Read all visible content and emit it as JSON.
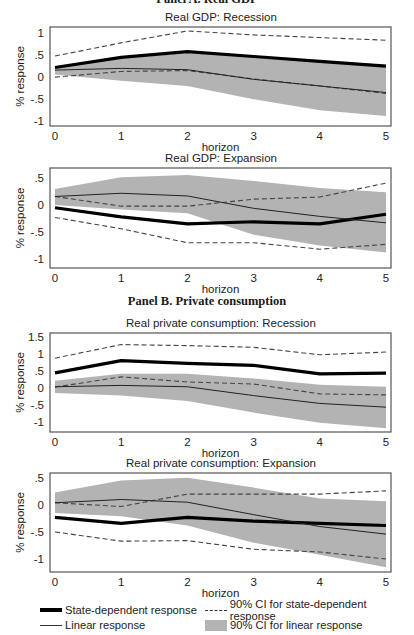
{
  "panels": [
    {
      "title": "Panel A. Real GDP",
      "top": -8
    },
    {
      "title": "Panel B. Private consumption",
      "top": 299
    }
  ],
  "chart_data": [
    {
      "type": "line",
      "title": "Real GDP: Recession",
      "xlabel": "horizon",
      "ylabel": "% response",
      "x": [
        0,
        1,
        2,
        3,
        4,
        5
      ],
      "yticks": [
        1,
        0.5,
        0,
        -0.5,
        -1
      ],
      "ytick_labels": [
        "1",
        ".5",
        "0",
        "-.5",
        "-1"
      ],
      "ylim": [
        -1.11,
        1.14
      ],
      "series": [
        {
          "name": "State-dependent response",
          "style": "thick",
          "values": [
            0.22,
            0.45,
            0.58,
            0.47,
            0.36,
            0.25
          ]
        },
        {
          "name": "90% CI for state-dependent response (upper)",
          "style": "dashed",
          "values": [
            0.48,
            0.78,
            1.05,
            0.96,
            0.9,
            0.84
          ]
        },
        {
          "name": "90% CI for state-dependent response (lower)",
          "style": "dashed",
          "values": [
            0.0,
            0.13,
            0.15,
            -0.04,
            -0.2,
            -0.37
          ]
        },
        {
          "name": "Linear response",
          "style": "thin",
          "values": [
            0.16,
            0.2,
            0.17,
            -0.05,
            -0.2,
            -0.35
          ]
        }
      ],
      "band": {
        "name": "90% CI for linear response",
        "upper": [
          0.25,
          0.42,
          0.55,
          0.46,
          0.37,
          0.28
        ],
        "lower": [
          0.06,
          -0.08,
          -0.2,
          -0.5,
          -0.75,
          -0.88
        ]
      }
    },
    {
      "type": "line",
      "title": "Real GDP: Expansion",
      "xlabel": "horizon",
      "ylabel": "% response",
      "x": [
        0,
        1,
        2,
        3,
        4,
        5
      ],
      "yticks": [
        0.5,
        0,
        -0.5,
        -1
      ],
      "ytick_labels": [
        ".5",
        "0",
        "-.5",
        "-1"
      ],
      "ylim": [
        -1.17,
        0.69
      ],
      "series": [
        {
          "name": "State-dependent response",
          "style": "thick",
          "values": [
            -0.05,
            -0.22,
            -0.35,
            -0.31,
            -0.35,
            -0.17
          ]
        },
        {
          "name": "90% CI for state-dependent response (upper)",
          "style": "dashed",
          "values": [
            0.16,
            -0.02,
            -0.02,
            0.11,
            0.15,
            0.41
          ]
        },
        {
          "name": "90% CI for state-dependent response (lower)",
          "style": "dashed",
          "values": [
            -0.23,
            -0.44,
            -0.7,
            -0.7,
            -0.82,
            -0.73
          ]
        },
        {
          "name": "Linear response",
          "style": "thin",
          "values": [
            0.16,
            0.22,
            0.17,
            -0.06,
            -0.21,
            -0.33
          ]
        }
      ],
      "band": {
        "name": "90% CI for linear response",
        "upper": [
          0.3,
          0.52,
          0.56,
          0.45,
          0.32,
          0.24
        ],
        "lower": [
          0.0,
          -0.08,
          -0.15,
          -0.55,
          -0.75,
          -0.88
        ]
      }
    },
    {
      "type": "line",
      "title": "Real private consumption: Recession",
      "xlabel": "horizon",
      "ylabel": "% response",
      "x": [
        0,
        1,
        2,
        3,
        4,
        5
      ],
      "yticks": [
        1.5,
        1,
        0.5,
        0,
        -0.5,
        -1
      ],
      "ytick_labels": [
        "1.5",
        "1",
        ".5",
        "0",
        "-.5",
        "-1"
      ],
      "ylim": [
        -1.29,
        1.62
      ],
      "series": [
        {
          "name": "State-dependent response",
          "style": "thick",
          "values": [
            0.45,
            0.81,
            0.73,
            0.67,
            0.42,
            0.44
          ]
        },
        {
          "name": "90% CI for state-dependent response (upper)",
          "style": "dashed",
          "values": [
            0.88,
            1.28,
            1.25,
            1.2,
            0.98,
            1.06
          ]
        },
        {
          "name": "90% CI for state-dependent response (lower)",
          "style": "dashed",
          "values": [
            0.03,
            0.33,
            0.18,
            0.12,
            -0.17,
            -0.2
          ]
        },
        {
          "name": "Linear response",
          "style": "thin",
          "values": [
            0.04,
            0.08,
            0.04,
            -0.22,
            -0.45,
            -0.56
          ]
        }
      ],
      "band": {
        "name": "90% CI for linear response",
        "upper": [
          0.22,
          0.42,
          0.42,
          0.28,
          0.1,
          0.04
        ],
        "lower": [
          -0.14,
          -0.22,
          -0.38,
          -0.72,
          -1.02,
          -1.18
        ]
      }
    },
    {
      "type": "line",
      "title": "Real private consumption: Expansion",
      "xlabel": "horizon",
      "ylabel": "% response",
      "x": [
        0,
        1,
        2,
        3,
        4,
        5
      ],
      "yticks": [
        0.5,
        0,
        -0.5,
        -1
      ],
      "ytick_labels": [
        ".5",
        "0",
        "-.5",
        "-1"
      ],
      "ylim": [
        -1.24,
        0.59
      ],
      "series": [
        {
          "name": "State-dependent response",
          "style": "thick",
          "values": [
            -0.23,
            -0.34,
            -0.23,
            -0.3,
            -0.34,
            -0.38
          ]
        },
        {
          "name": "90% CI for state-dependent response (upper)",
          "style": "dashed",
          "values": [
            0.04,
            -0.03,
            0.2,
            0.2,
            0.2,
            0.26
          ]
        },
        {
          "name": "90% CI for state-dependent response (lower)",
          "style": "dashed",
          "values": [
            -0.5,
            -0.67,
            -0.66,
            -0.82,
            -0.87,
            -1.0
          ]
        },
        {
          "name": "Linear response",
          "style": "thin",
          "values": [
            0.04,
            0.1,
            0.05,
            -0.18,
            -0.4,
            -0.54
          ]
        }
      ],
      "band": {
        "name": "90% CI for linear response",
        "upper": [
          0.23,
          0.45,
          0.5,
          0.32,
          0.12,
          0.07
        ],
        "lower": [
          -0.15,
          -0.21,
          -0.38,
          -0.7,
          -0.92,
          -1.15
        ]
      }
    }
  ],
  "layout": {
    "frames": [
      {
        "title_top": 12,
        "top": 27,
        "bottom": 126
      },
      {
        "title_top": 153,
        "top": 168,
        "bottom": 268
      },
      {
        "title_top": 318,
        "top": 333,
        "bottom": 432
      },
      {
        "title_top": 458,
        "top": 473,
        "bottom": 572
      }
    ],
    "frame_left": 50,
    "frame_right": 391,
    "x_first": 55,
    "x_last": 386
  },
  "legend": {
    "items": [
      {
        "label": "State-dependent response",
        "swatch": "thick-line"
      },
      {
        "label": "Linear response",
        "swatch": "thin-line"
      },
      {
        "label": "90% CI for state-dependent response",
        "swatch": "dashed-line"
      },
      {
        "label": "90% CI for linear response",
        "swatch": "gray-box"
      }
    ]
  },
  "colors": {
    "band": "#b3b3b3",
    "line": "#000000",
    "dashed": "#444444",
    "frame": "#555555",
    "text": "#222222"
  }
}
